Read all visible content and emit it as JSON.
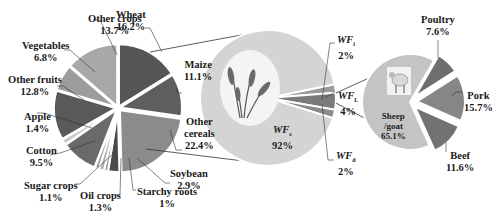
{
  "chart_data": [
    {
      "type": "pie",
      "title": "Crop water footprint composition",
      "categories": [
        "Wheat",
        "Maize",
        "Other cereals",
        "Soybean",
        "Starchy roots",
        "Oil crops",
        "Sugar crops",
        "Cotton",
        "Apple",
        "Other fruits",
        "Vegetables",
        "Other crops"
      ],
      "values": [
        16.2,
        11.1,
        22.4,
        2.9,
        1.0,
        1.3,
        1.1,
        9.5,
        1.4,
        12.8,
        6.8,
        13.7
      ],
      "labels": [
        "16.2%",
        "11.1%",
        "22.4%",
        "2.9%",
        "1%",
        "1.3%",
        "1.1%",
        "9.5%",
        "1.4%",
        "12.8%",
        "6.8%",
        "13.7%"
      ],
      "colors": [
        "#555555",
        "#5e5e5e",
        "#8c8c8c",
        "#4a4a4a",
        "#9a9a9a",
        "#b0b0b0",
        "#a0a0a0",
        "#6a6a6a",
        "#c8c8c8",
        "#595959",
        "#9c9c9c",
        "#a8a8a8"
      ]
    },
    {
      "type": "pie",
      "title": "Total water footprint composition",
      "categories": [
        "WF_c",
        "WF_i",
        "WF_L",
        "WF_d"
      ],
      "values": [
        92,
        2,
        4,
        2
      ],
      "labels": [
        "92%",
        "2%",
        "4%",
        "2%"
      ],
      "colors": [
        "#d4d4d4",
        "#9a9a9a",
        "#7a7a7a",
        "#8a8a8a"
      ]
    },
    {
      "type": "pie",
      "title": "Livestock water footprint composition",
      "categories": [
        "Sheep/goat",
        "Poultry",
        "Pork",
        "Beef"
      ],
      "values": [
        65.1,
        7.6,
        15.7,
        11.6
      ],
      "labels": [
        "65.1%",
        "7.6%",
        "15.7%",
        "11.6%"
      ],
      "colors": [
        "#c4c4c4",
        "#6e6e6e",
        "#868686",
        "#727272"
      ]
    }
  ],
  "labels": {
    "wheat": {
      "name": "Wheat",
      "val": "16.2%"
    },
    "maize": {
      "name": "Maize",
      "val": "11.1%"
    },
    "other_cereals": {
      "name1": "Other",
      "name2": "cereals",
      "val": "22.4%"
    },
    "soybean": {
      "name": "Soybean",
      "val": "2.9%"
    },
    "starchy_roots": {
      "name": "Starchy roots",
      "val": "1%"
    },
    "oil_crops": {
      "name": "Oil crops",
      "val": "1.3%"
    },
    "sugar_crops": {
      "name": "Sugar crops",
      "val": "1.1%"
    },
    "cotton": {
      "name": "Cotton",
      "val": "9.5%"
    },
    "apple": {
      "name": "Apple",
      "val": "1.4%"
    },
    "other_fruits": {
      "name": "Other fruits",
      "val": "12.8%"
    },
    "vegetables": {
      "name": "Vegetables",
      "val": "6.8%"
    },
    "other_crops": {
      "name": "Other crops",
      "val": "13.7%"
    },
    "wf_c": {
      "base": "WF",
      "sub": "c",
      "val": "92%"
    },
    "wf_i": {
      "base": "WF",
      "sub": "i",
      "val": "2%"
    },
    "wf_l": {
      "base": "WF",
      "sub": "L",
      "val": "4%"
    },
    "wf_d": {
      "base": "WF",
      "sub": "d",
      "val": "2%"
    },
    "sheep": {
      "name1": "Sheep",
      "name2": "/goat",
      "val": "65.1%"
    },
    "poultry": {
      "name": "Poultry",
      "val": "7.6%"
    },
    "pork": {
      "name": "Pork",
      "val": "15.7%"
    },
    "beef": {
      "name": "Beef",
      "val": "11.6%"
    }
  }
}
